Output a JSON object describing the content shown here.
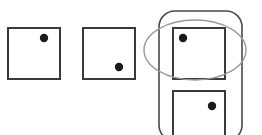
{
  "figure": {
    "type": "diagram",
    "canvas": {
      "width": 262,
      "height": 135,
      "background": "#ffffff"
    },
    "colors": {
      "square_stroke": "#3a3a3a",
      "dot_fill": "#1a1a1a",
      "ellipse_stroke": "#9a9a9a",
      "container_stroke": "#4a4a4a",
      "background": "#ffffff"
    },
    "stroke_widths": {
      "square": 2,
      "ellipse": 1.4,
      "container": 1.6
    },
    "squares": [
      {
        "name": "square-1",
        "label": "square-1",
        "x": 8,
        "y": 28,
        "width": 52,
        "height": 51,
        "dot": {
          "cx": 44,
          "cy": 38,
          "r": 4.2,
          "position": "top-right"
        }
      },
      {
        "name": "square-2",
        "label": "square-2",
        "x": 83,
        "y": 28,
        "width": 52,
        "height": 51,
        "dot": {
          "cx": 119,
          "cy": 67,
          "r": 4.2,
          "position": "bottom-right"
        }
      },
      {
        "name": "square-3",
        "label": "square-3",
        "x": 173,
        "y": 28,
        "width": 52,
        "height": 51,
        "dot": {
          "cx": 183,
          "cy": 38,
          "r": 4.2,
          "position": "top-left"
        }
      },
      {
        "name": "square-4",
        "label": "square-4",
        "x": 173,
        "y": 91,
        "width": 52,
        "height": 52,
        "dot": {
          "cx": 212,
          "cy": 106,
          "r": 4.2,
          "position": "top-right"
        }
      }
    ],
    "ellipse": {
      "name": "highlight-ellipse",
      "cx": 195,
      "cy": 50,
      "rx": 51,
      "ry": 30
    },
    "container": {
      "name": "rounded-container",
      "x": 159,
      "y": 11,
      "width": 83,
      "height": 130,
      "rx": 16,
      "ry": 16
    }
  }
}
